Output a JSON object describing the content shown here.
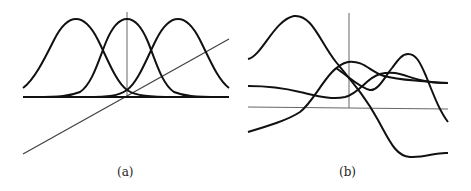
{
  "figure": {
    "panels": [
      {
        "id": "a",
        "caption": "(a)",
        "description": "Three identical Gaussian bumps shifted along a baseline, a vertical axis through the middle bump, and a diagonal straight line"
      },
      {
        "id": "b",
        "caption": "(b)",
        "description": "Four smooth curves crossing horizontal and vertical axes"
      }
    ],
    "colors": {
      "curve": "#111111",
      "axis": "#555555",
      "background": "#ffffff"
    }
  }
}
